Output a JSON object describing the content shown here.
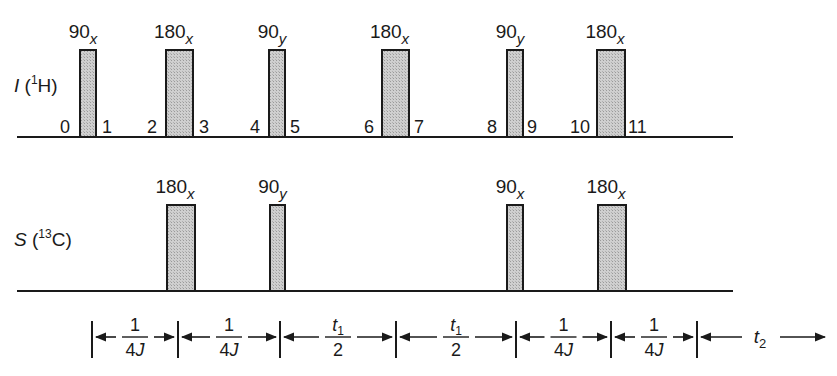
{
  "diagram": {
    "type": "nmr-pulse-sequence",
    "channels": [
      {
        "name": "I",
        "nucleus_mass": "1",
        "nucleus": "H",
        "pulses": [
          {
            "angle": "90",
            "phase": "x",
            "x": 80,
            "width": 16
          },
          {
            "angle": "180",
            "phase": "x",
            "x": 166,
            "width": 27
          },
          {
            "angle": "90",
            "phase": "y",
            "x": 269,
            "width": 16
          },
          {
            "angle": "180",
            "phase": "x",
            "x": 382,
            "width": 27
          },
          {
            "angle": "90",
            "phase": "y",
            "x": 507,
            "width": 16
          },
          {
            "angle": "180",
            "phase": "x",
            "x": 597,
            "width": 28
          }
        ],
        "time_points": [
          {
            "label": "0",
            "x": 60
          },
          {
            "label": "1",
            "x": 102
          },
          {
            "label": "2",
            "x": 147
          },
          {
            "label": "3",
            "x": 199
          },
          {
            "label": "4",
            "x": 250
          },
          {
            "label": "5",
            "x": 290
          },
          {
            "label": "6",
            "x": 364
          },
          {
            "label": "7",
            "x": 414
          },
          {
            "label": "8",
            "x": 487
          },
          {
            "label": "9",
            "x": 527
          },
          {
            "label": "10",
            "x": 570
          },
          {
            "label": "11",
            "x": 628
          }
        ]
      },
      {
        "name": "S",
        "nucleus_mass": "13",
        "nucleus": "C",
        "pulses": [
          {
            "angle": "180",
            "phase": "x",
            "x": 167,
            "width": 28
          },
          {
            "angle": "90",
            "phase": "y",
            "x": 270,
            "width": 15
          },
          {
            "angle": "90",
            "phase": "x",
            "x": 507,
            "width": 16
          },
          {
            "angle": "180",
            "phase": "x",
            "x": 598,
            "width": 28
          }
        ]
      }
    ],
    "delays": [
      {
        "numerator": "1",
        "num_sub": "",
        "denominator": "4J",
        "from": 92,
        "to": 178
      },
      {
        "numerator": "1",
        "num_sub": "",
        "denominator": "4J",
        "from": 178,
        "to": 280
      },
      {
        "numerator": "t",
        "num_sub": "1",
        "denominator": "2",
        "from": 280,
        "to": 396
      },
      {
        "numerator": "t",
        "num_sub": "1",
        "denominator": "2",
        "from": 396,
        "to": 516
      },
      {
        "numerator": "1",
        "num_sub": "",
        "denominator": "4J",
        "from": 516,
        "to": 611
      },
      {
        "numerator": "1",
        "num_sub": "",
        "denominator": "4J",
        "from": 611,
        "to": 697
      }
    ],
    "acquisition": {
      "symbol": "t",
      "sub": "2",
      "from": 697,
      "to": 825
    },
    "colors": {
      "pulse_fill": "#c8c8c8",
      "line": "#1a1a1a"
    }
  }
}
